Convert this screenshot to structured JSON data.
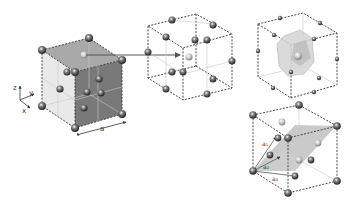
{
  "figure": {
    "axes": {
      "z": "z",
      "y": "y",
      "x": "x"
    },
    "lattice_constant_label": "a",
    "primitive_vectors": [
      "a₁",
      "a₂",
      "a₃"
    ],
    "colors": {
      "atom": "#555555",
      "atom_highlight": "#bbbbbb",
      "face_dark": "#6e6e6e",
      "face_light": "#d8d8d8",
      "wigner_seitz": "#cfcfcf",
      "primitive_plane": "#9e9e9e"
    },
    "panels": [
      {
        "id": "conventional-cell",
        "label": "conventional cubic cell with shaded faces"
      },
      {
        "id": "fcc-cell",
        "label": "fcc cell with highlighted central atom"
      },
      {
        "id": "wigner-seitz-cell",
        "label": "Wigner-Seitz cell"
      },
      {
        "id": "primitive-cell",
        "label": "primitive cell with vectors"
      }
    ]
  }
}
